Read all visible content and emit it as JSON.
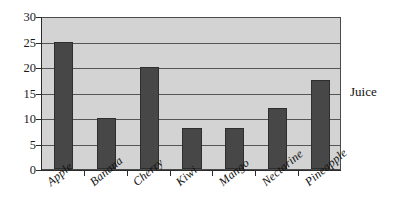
{
  "chart_data": {
    "type": "bar",
    "title": "",
    "xlabel": "",
    "ylabel": "",
    "categories": [
      "Apple",
      "Banana",
      "Cherry",
      "Kiwi",
      "Mango",
      "Nectarine",
      "Pineapple"
    ],
    "values": [
      25,
      10,
      20,
      8,
      8,
      12,
      17.5
    ],
    "series": [
      {
        "name": "Juice",
        "values": [
          25,
          10,
          20,
          8,
          8,
          12,
          17.5
        ]
      }
    ],
    "ylim": [
      0,
      30
    ],
    "ytick_step": 5,
    "yticks": [
      "0",
      "5",
      "10",
      "15",
      "20",
      "25",
      "30"
    ],
    "grid": true,
    "legend_position": "right",
    "legend_entries": [
      "Juice"
    ],
    "colors": {
      "bar_fill": "#474747",
      "bar_border": "#2e2e2e",
      "plot_background": "#d3d3d3",
      "gridline": "#555555",
      "axis": "#2b2b2b",
      "text": "#111111",
      "page_background": "#ffffff"
    }
  }
}
